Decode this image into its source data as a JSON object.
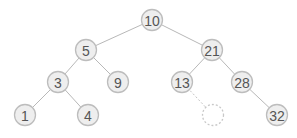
{
  "diagram": {
    "type": "binary-search-tree",
    "nodes": [
      {
        "id": "n10",
        "label": "10",
        "x": 152,
        "y": 20
      },
      {
        "id": "n5",
        "label": "5",
        "x": 86,
        "y": 50
      },
      {
        "id": "n21",
        "label": "21",
        "x": 212,
        "y": 50
      },
      {
        "id": "n3",
        "label": "3",
        "x": 58,
        "y": 82
      },
      {
        "id": "n9",
        "label": "9",
        "x": 118,
        "y": 82
      },
      {
        "id": "n13",
        "label": "13",
        "x": 182,
        "y": 82
      },
      {
        "id": "n28",
        "label": "28",
        "x": 242,
        "y": 82
      },
      {
        "id": "n1",
        "label": "1",
        "x": 25,
        "y": 115
      },
      {
        "id": "n4",
        "label": "4",
        "x": 88,
        "y": 115
      },
      {
        "id": "nEmpty",
        "label": "",
        "x": 213,
        "y": 115,
        "placeholder": true
      },
      {
        "id": "n32",
        "label": "32",
        "x": 277,
        "y": 115
      }
    ],
    "edges": [
      {
        "from": "n10",
        "to": "n5"
      },
      {
        "from": "n10",
        "to": "n21"
      },
      {
        "from": "n5",
        "to": "n3"
      },
      {
        "from": "n5",
        "to": "n9"
      },
      {
        "from": "n21",
        "to": "n13"
      },
      {
        "from": "n21",
        "to": "n28"
      },
      {
        "from": "n3",
        "to": "n1"
      },
      {
        "from": "n3",
        "to": "n4"
      },
      {
        "from": "n13",
        "to": "nEmpty",
        "dashed": true
      },
      {
        "from": "n28",
        "to": "n32"
      }
    ],
    "colors": {
      "node_fill": "#eeeeee",
      "node_stroke": "#bdbdbd",
      "edge": "#b8b8b8",
      "text": "#555555"
    }
  }
}
